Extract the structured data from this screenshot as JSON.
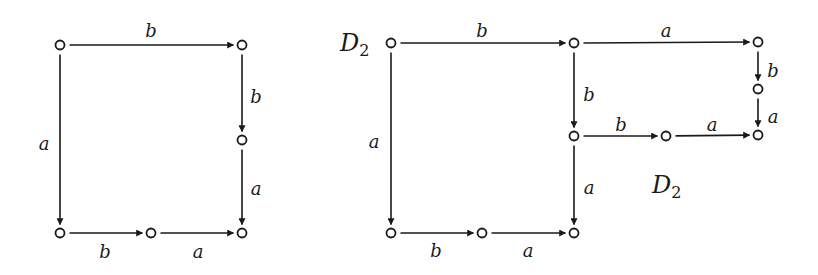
{
  "diagrams": [
    {
      "id": "left",
      "nodes": [
        {
          "id": "L1",
          "x": 60,
          "y": 45
        },
        {
          "id": "L2",
          "x": 242,
          "y": 45
        },
        {
          "id": "L3",
          "x": 242,
          "y": 140
        },
        {
          "id": "L4",
          "x": 60,
          "y": 233
        },
        {
          "id": "L5",
          "x": 151,
          "y": 233
        },
        {
          "id": "L6",
          "x": 242,
          "y": 233
        }
      ],
      "edges": [
        {
          "from": "L1",
          "to": "L2",
          "label": "b",
          "lx": 151,
          "ly": 32
        },
        {
          "from": "L2",
          "to": "L3",
          "label": "b",
          "lx": 256,
          "ly": 98
        },
        {
          "from": "L3",
          "to": "L6",
          "label": "a",
          "lx": 256,
          "ly": 190
        },
        {
          "from": "L1",
          "to": "L4",
          "label": "a",
          "lx": 44,
          "ly": 145
        },
        {
          "from": "L4",
          "to": "L5",
          "label": "b",
          "lx": 105,
          "ly": 253
        },
        {
          "from": "L5",
          "to": "L6",
          "label": "a",
          "lx": 198,
          "ly": 253
        }
      ],
      "annotations": []
    },
    {
      "id": "right",
      "nodes": [
        {
          "id": "R1",
          "x": 391,
          "y": 43
        },
        {
          "id": "R2",
          "x": 574,
          "y": 43
        },
        {
          "id": "R3",
          "x": 758,
          "y": 42
        },
        {
          "id": "R4",
          "x": 758,
          "y": 89
        },
        {
          "id": "R5",
          "x": 758,
          "y": 135
        },
        {
          "id": "R6",
          "x": 574,
          "y": 136
        },
        {
          "id": "R7",
          "x": 666,
          "y": 136
        },
        {
          "id": "R8",
          "x": 391,
          "y": 233
        },
        {
          "id": "R9",
          "x": 482,
          "y": 233
        },
        {
          "id": "R10",
          "x": 574,
          "y": 233
        }
      ],
      "edges": [
        {
          "from": "R1",
          "to": "R2",
          "label": "b",
          "lx": 482,
          "ly": 32
        },
        {
          "from": "R2",
          "to": "R3",
          "label": "a",
          "lx": 666,
          "ly": 32
        },
        {
          "from": "R3",
          "to": "R4",
          "label": "b",
          "lx": 773,
          "ly": 72
        },
        {
          "from": "R4",
          "to": "R5",
          "label": "a",
          "lx": 773,
          "ly": 118
        },
        {
          "from": "R2",
          "to": "R6",
          "label": "b",
          "lx": 589,
          "ly": 96
        },
        {
          "from": "R6",
          "to": "R7",
          "label": "b",
          "lx": 621,
          "ly": 126
        },
        {
          "from": "R7",
          "to": "R5",
          "label": "a",
          "lx": 712,
          "ly": 126
        },
        {
          "from": "R6",
          "to": "R10",
          "label": "a",
          "lx": 589,
          "ly": 189
        },
        {
          "from": "R1",
          "to": "R8",
          "label": "a",
          "lx": 374,
          "ly": 143
        },
        {
          "from": "R8",
          "to": "R9",
          "label": "b",
          "lx": 436,
          "ly": 252
        },
        {
          "from": "R9",
          "to": "R10",
          "label": "a",
          "lx": 528,
          "ly": 252
        }
      ],
      "annotations": [
        {
          "text": "D",
          "sub": "2",
          "x": 340,
          "y": 51
        },
        {
          "text": "D",
          "sub": "2",
          "x": 652,
          "y": 193
        }
      ]
    }
  ],
  "style": {
    "stroke_color": "#1a1a1a",
    "background": "#ffffff"
  }
}
